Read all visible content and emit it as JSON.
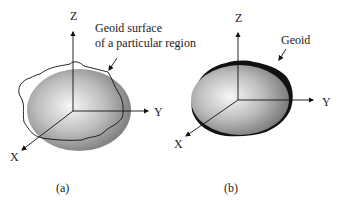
{
  "panels": [
    {
      "id": "a",
      "caption": "(a)",
      "axes": {
        "z": "Z",
        "y": "Y",
        "x": "X"
      },
      "annotation": {
        "line1": "Geoid surface",
        "line2": "of a particular region"
      }
    },
    {
      "id": "b",
      "caption": "(b)",
      "axes": {
        "z": "Z",
        "y": "Y",
        "x": "X"
      },
      "annotation": {
        "line1": "Geoid"
      }
    }
  ],
  "colors": {
    "ellipsoid_light": "#f4f4f4",
    "ellipsoid_dark": "#8a8a8a",
    "line": "#111111"
  }
}
